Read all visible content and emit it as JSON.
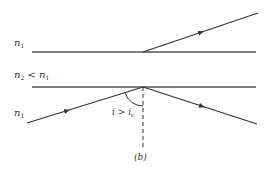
{
  "diagram": {
    "media": {
      "top": {
        "symbol": "n",
        "subscript": "1"
      },
      "middle": {
        "symbol": "n",
        "subscript": "2",
        "relation": " < ",
        "compare_symbol": "n",
        "compare_subscript": "1"
      },
      "bottom": {
        "symbol": "n",
        "subscript": "1"
      }
    },
    "angle_label": {
      "symbol": "i",
      "relation": " > ",
      "compare_symbol": "i",
      "compare_subscript": "c"
    },
    "caption": "(b)",
    "line_color": "#333333",
    "boundary_color": "#555555",
    "rays": [
      {
        "name": "incident",
        "from": [
          27,
          123
        ],
        "to": [
          143,
          87
        ]
      },
      {
        "name": "reflected",
        "from": [
          143,
          87
        ],
        "to": [
          257,
          124
        ]
      },
      {
        "name": "upper",
        "from": [
          143,
          52
        ],
        "to": [
          258,
          13
        ]
      }
    ],
    "boundaries": [
      {
        "name": "upper-interface",
        "y": 52,
        "x1": 32,
        "x2": 256
      },
      {
        "name": "lower-interface",
        "y": 87,
        "x1": 32,
        "x2": 256
      }
    ],
    "normal": {
      "x": 143,
      "y1": 87,
      "y2": 150,
      "style": "dashed"
    }
  }
}
